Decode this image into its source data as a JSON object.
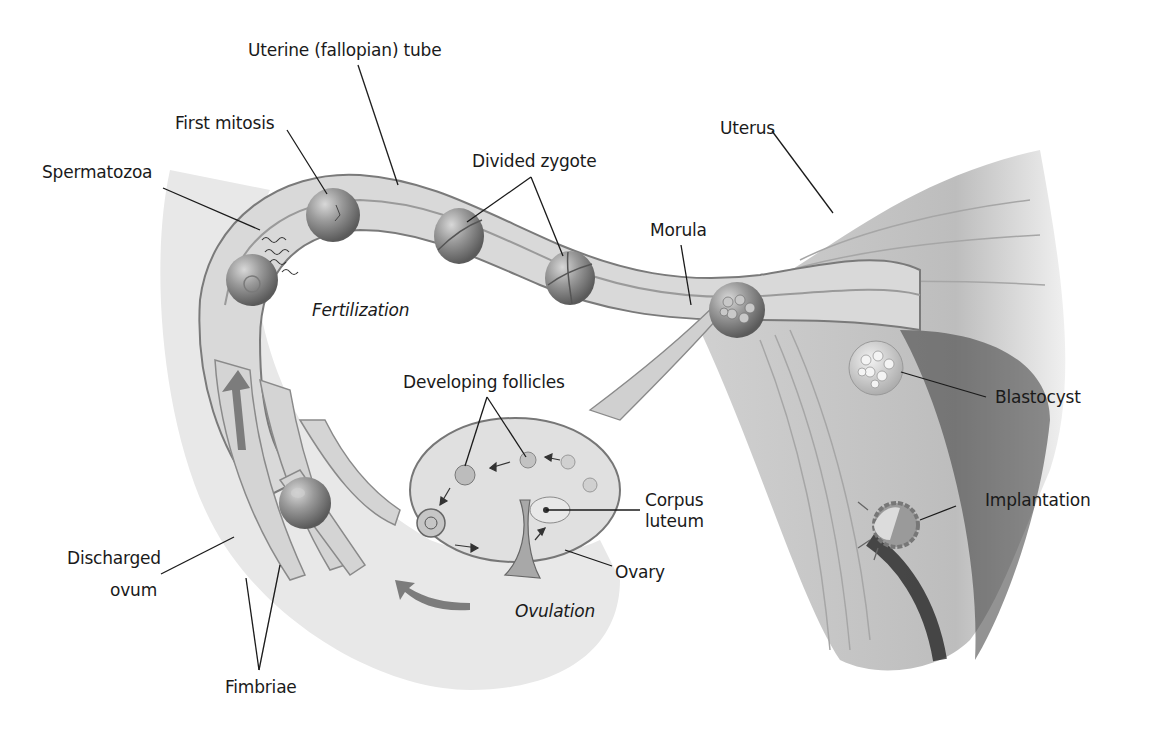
{
  "figure": {
    "labels": {
      "uterine_tube": "Uterine (fallopian) tube",
      "first_mitosis": "First mitosis",
      "spermatozoa": "Spermatozoa",
      "divided_zygote": "Divided zygote",
      "uterus": "Uterus",
      "morula": "Morula",
      "fertilization": "Fertilization",
      "developing_follicles": "Developing follicles",
      "blastocyst": "Blastocyst",
      "corpus_luteum_line1": "Corpus",
      "corpus_luteum_line2": "luteum",
      "implantation": "Implantation",
      "discharged_ovum_line1": "Discharged",
      "discharged_ovum_line2": "ovum",
      "ovary": "Ovary",
      "ovulation": "Ovulation",
      "fimbriae": "Fimbriae"
    },
    "colors": {
      "tissue_light": "#e6e6e6",
      "tissue_mid": "#c8c8c8",
      "tissue_dark": "#8a8a8a",
      "cell": "#8f8f8f",
      "shadow": "#2a2a2a",
      "text": "#1a1a1a"
    }
  }
}
